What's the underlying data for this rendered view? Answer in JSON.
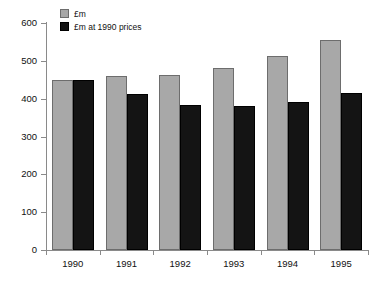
{
  "chart_data": {
    "type": "bar",
    "title": "",
    "subtitle": "",
    "xlabel": "",
    "ylabel": "£ millions",
    "categories": [
      "1990",
      "1991",
      "1992",
      "1993",
      "1994",
      "1995"
    ],
    "series": [
      {
        "name": "£m",
        "color": "#a8a8a8",
        "values": [
          450,
          460,
          463,
          480,
          512,
          555
        ]
      },
      {
        "name": "£m at 1990 prices",
        "color": "#141414",
        "values": [
          450,
          412,
          383,
          381,
          391,
          415
        ]
      }
    ],
    "ylim": [
      0,
      600
    ],
    "yticks": [
      0,
      100,
      200,
      300,
      400,
      500,
      600
    ],
    "ytick_labels": [
      "0",
      "100",
      "200",
      "300",
      "400",
      "500",
      "600"
    ],
    "grid": false,
    "legend_position": "top-left",
    "annotations": []
  }
}
